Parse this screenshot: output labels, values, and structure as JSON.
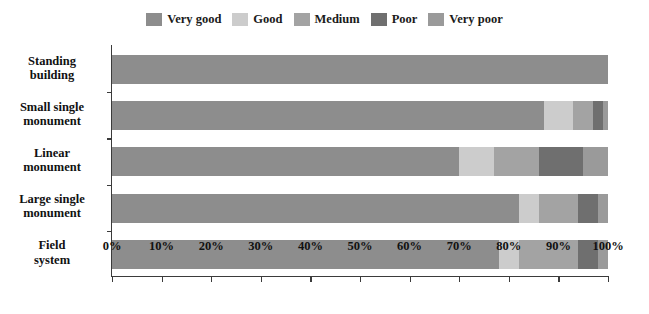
{
  "chart_data": {
    "type": "bar",
    "orientation": "horizontal",
    "stacked": true,
    "normalized": "percent",
    "title": "",
    "xlabel": "",
    "ylabel": "",
    "xlim": [
      0,
      100
    ],
    "grid": false,
    "legend_position": "top-center",
    "categories": [
      "Standing building",
      "Small single monument",
      "Linear monument",
      "Large single monument",
      "Field system"
    ],
    "category_lines": [
      [
        "Standing",
        "building"
      ],
      [
        "Small single",
        "monument"
      ],
      [
        "Linear",
        "monument"
      ],
      [
        "Large single",
        "monument"
      ],
      [
        "Field",
        "system"
      ]
    ],
    "series": [
      {
        "name": "Very good",
        "color": "#8d8d8d",
        "values": [
          100,
          87,
          70,
          82,
          78
        ]
      },
      {
        "name": "Good",
        "color": "#cccccc",
        "values": [
          0,
          6,
          7,
          4,
          4
        ]
      },
      {
        "name": "Medium",
        "color": "#a3a3a3",
        "values": [
          0,
          4,
          9,
          8,
          12
        ]
      },
      {
        "name": "Poor",
        "color": "#6f6f6f",
        "values": [
          0,
          2,
          9,
          4,
          4
        ]
      },
      {
        "name": "Very poor",
        "color": "#9a9a9a",
        "values": [
          0,
          1,
          5,
          2,
          2
        ]
      }
    ],
    "x_ticks": [
      0,
      10,
      20,
      30,
      40,
      50,
      60,
      70,
      80,
      90,
      100
    ],
    "x_tick_labels": [
      "0%",
      "10%",
      "20%",
      "30%",
      "40%",
      "50%",
      "60%",
      "70%",
      "80%",
      "90%",
      "100%"
    ],
    "axis_color": "#3b3b3b",
    "background": "#ffffff"
  }
}
